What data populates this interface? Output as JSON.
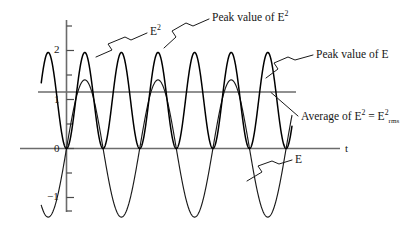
{
  "figure": {
    "background": "#ffffff",
    "ink_color": "#161616",
    "axis_color": "#6b6b6b"
  },
  "axes": {
    "x_axis_label": "t",
    "y_ticks": [
      {
        "value": 2,
        "label": "2"
      },
      {
        "value": 1,
        "label": "1"
      },
      {
        "value": 0,
        "label": "0"
      },
      {
        "value": -1,
        "label": "−1"
      }
    ],
    "unlabeled_tick_values": [
      2.5,
      1.5,
      0.5,
      -0.5,
      -1.5
    ]
  },
  "labels": {
    "e_squared_curve": "E",
    "e_squared_curve_sup": "2",
    "peak_value_of_e_squared": "Peak value of E",
    "peak_value_of_e_squared_sup": "2",
    "peak_value_of_e": "Peak value of E",
    "average_prefix": "Average of E",
    "average_sup1": "2",
    "average_mid": " = E",
    "average_sup2": "2",
    "average_sub2": "rms",
    "e_curve": "E"
  },
  "chart_data": {
    "type": "line",
    "title": "",
    "xlabel": "t",
    "ylabel": "",
    "xlim": [
      0,
      3.08
    ],
    "ylim": [
      -1.75,
      2.6
    ],
    "grid": false,
    "legend": "inline-annotations",
    "series": [
      {
        "name": "E",
        "function": "E(t) = 1.4 * sin(2*pi*t)",
        "amplitude": 1.4,
        "cycles": 3.08,
        "peak_value": 1.4,
        "min_value": -1.4,
        "color": "#1a1a1a"
      },
      {
        "name": "E^2",
        "function": "E^2(t) = 1.96 * sin^2(2*pi*t)",
        "amplitude": 1.96,
        "cycles": 6.16,
        "peak_value": 1.96,
        "min_value": 0,
        "color": "#000000"
      }
    ],
    "reference_lines": [
      {
        "name": "Average of E^2 = E^2_rms",
        "orientation": "horizontal",
        "value": 0.98,
        "color": "#6b6b6b"
      },
      {
        "name": "t axis",
        "orientation": "horizontal",
        "value": 0,
        "color": "#6b6b6b"
      }
    ],
    "annotations": [
      {
        "text": "E^2",
        "points_to": "E-squared curve"
      },
      {
        "text": "Peak value of E^2",
        "points_to": "peak of E-squared curve"
      },
      {
        "text": "Peak value of E",
        "points_to": "peak of E curve"
      },
      {
        "text": "Average of E^2 = E^2_rms",
        "points_to": "horizontal average line"
      },
      {
        "text": "E",
        "points_to": "E curve descending branch"
      }
    ]
  }
}
